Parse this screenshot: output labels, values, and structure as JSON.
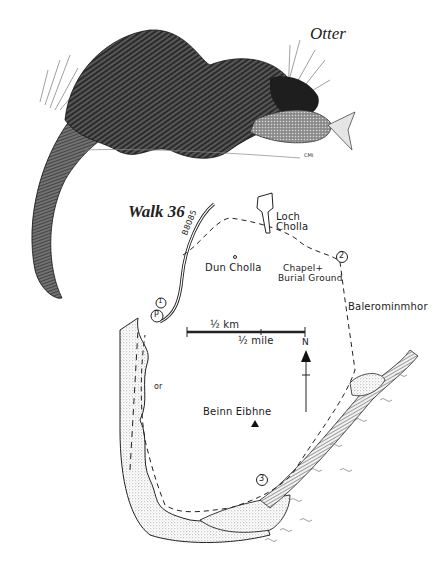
{
  "page": {
    "illustration": {
      "title": "Otter",
      "artist_initials": "CMI",
      "subject": "otter eating a fish"
    },
    "map": {
      "title": "Walk 36",
      "road_label": "B8085",
      "places": [
        {
          "name": "Loch Cholla",
          "type": "loch"
        },
        {
          "name": "Dun Cholla",
          "type": "fort"
        },
        {
          "name": "Chapel & Burial Ground",
          "label_line1": "Chapel+",
          "label_line2": "Burial Ground",
          "type": "chapel"
        },
        {
          "name": "Balerominmhor",
          "type": "farm"
        },
        {
          "name": "Beinn Eibhne",
          "type": "summit"
        }
      ],
      "waypoints": [
        "1",
        "P",
        "2",
        "3"
      ],
      "shore_label": "or",
      "scale": {
        "km_label": "½ km",
        "mile_label": "½ mile"
      },
      "north_label": "N",
      "colors": {
        "ink": "#1a1a1a",
        "paper": "#ffffff",
        "stipple": "#9a9a9a"
      }
    }
  }
}
